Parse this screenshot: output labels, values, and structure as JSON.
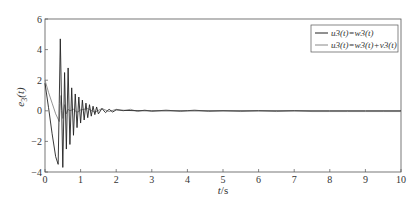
{
  "chart_data": {
    "type": "line",
    "title": "",
    "xlabel": "t/s",
    "ylabel": "e3(t)",
    "xlim": [
      0,
      10
    ],
    "ylim": [
      -4,
      6
    ],
    "xticks": [
      0,
      1,
      2,
      3,
      4,
      5,
      6,
      7,
      8,
      9,
      10
    ],
    "yticks": [
      -4,
      -2,
      0,
      2,
      4,
      6
    ],
    "grid": false,
    "legend_position": "upper right",
    "series": [
      {
        "name": "u3(t)=w3(t)",
        "color": "#222222",
        "x": [
          0,
          0.1,
          0.2,
          0.3,
          0.37,
          0.4,
          0.43,
          0.47,
          0.5,
          0.55,
          0.6,
          0.65,
          0.7,
          0.75,
          0.8,
          0.85,
          0.9,
          0.95,
          1.0,
          1.05,
          1.1,
          1.15,
          1.2,
          1.25,
          1.3,
          1.35,
          1.4,
          1.45,
          1.5,
          1.6,
          1.7,
          1.8,
          1.9,
          2.0,
          2.2,
          2.5,
          3.0,
          4.0,
          5.0,
          6.0,
          7.0,
          8.0,
          9.0,
          10.0
        ],
        "y": [
          1.8,
          0.2,
          -1.5,
          -3.0,
          -3.5,
          0.5,
          4.7,
          0.0,
          -3.7,
          2.5,
          -2.5,
          2.8,
          -2.2,
          1.5,
          -1.6,
          1.1,
          -1.1,
          0.9,
          -0.8,
          0.7,
          -0.6,
          0.5,
          -0.45,
          0.4,
          -0.35,
          0.3,
          -0.25,
          0.25,
          -0.2,
          0.15,
          -0.12,
          0.1,
          -0.08,
          0.06,
          0.03,
          0.01,
          0.0,
          0.0,
          0.0,
          0.0,
          0.0,
          0.0,
          0.0,
          0.0
        ]
      },
      {
        "name": "u3(t)=w3(t)+v3(t)",
        "color": "#888888",
        "x": [
          0,
          0.1,
          0.2,
          0.3,
          0.4,
          0.45,
          0.5,
          0.55,
          0.6,
          0.65,
          0.7,
          0.8,
          0.9,
          1.0,
          1.2,
          1.4,
          1.6,
          1.8,
          2.0,
          2.2,
          2.4,
          2.6,
          2.8,
          3.0,
          3.4,
          3.8,
          4.2,
          4.6,
          5.0,
          5.5,
          6.0,
          6.5,
          7.0,
          7.5,
          8.0,
          8.5,
          9.0,
          9.5,
          10.0
        ],
        "y": [
          2.0,
          1.2,
          0.5,
          -0.2,
          -0.7,
          1.0,
          -0.5,
          0.4,
          -0.2,
          0.1,
          0.0,
          0.1,
          -0.1,
          0.05,
          0.15,
          -0.1,
          0.15,
          -0.05,
          0.1,
          0.0,
          0.1,
          -0.05,
          0.05,
          -0.05,
          0.05,
          -0.05,
          0.05,
          -0.05,
          0.0,
          -0.05,
          0.0,
          -0.05,
          0.0,
          -0.05,
          -0.05,
          -0.05,
          -0.05,
          -0.05,
          -0.05
        ]
      }
    ]
  },
  "axes": {
    "xlabel_main": "t",
    "xlabel_unit": "/s",
    "ylabel_main": "e",
    "ylabel_sub": "3",
    "ylabel_arg": "(t)"
  },
  "legend": {
    "items": [
      {
        "label": "u3(t)=w3(t)",
        "color": "#222222"
      },
      {
        "label": "u3(t)=w3(t)+v3(t)",
        "color": "#888888"
      }
    ]
  }
}
